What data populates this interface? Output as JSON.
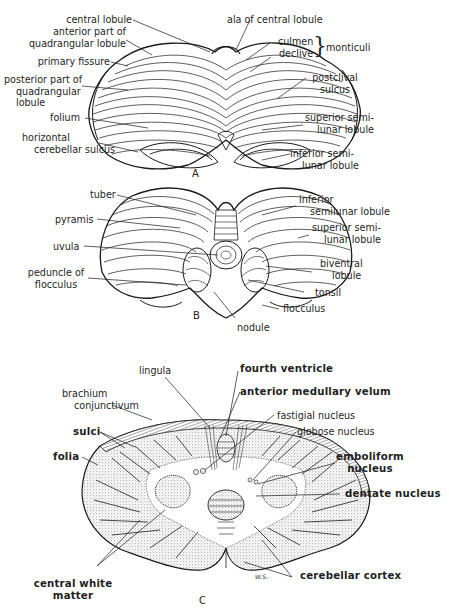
{
  "figure": {
    "panels": [
      {
        "id": "A",
        "view": "superior surface of cerebellum",
        "labels": {
          "central_lobule": "central lobule",
          "anterior_quadrangular": [
            "anterior part of",
            "quadrangular lobule"
          ],
          "primary_fissure": "primary fissure",
          "posterior_quadrangular": [
            "posterior part of",
            "quadrangular",
            "lobule"
          ],
          "folium": "folium",
          "horizontal_sulcus": [
            "horizontal",
            "cerebellar sulcus"
          ],
          "ala_central_lobule": "ala of central lobule",
          "culmen": "culmen",
          "declive": "declive",
          "monticuli": "monticuli",
          "postclival_sulcus": [
            "postclival",
            "sulcus"
          ],
          "superior_semilunar": [
            "superior semi-",
            "lunar lobule"
          ],
          "inferior_semilunar": [
            "inferior semi-",
            "lunar lobule"
          ]
        }
      },
      {
        "id": "B",
        "view": "inferior surface of cerebellum",
        "labels": {
          "tuber": "tuber",
          "pyramis": "pyramis",
          "uvula": "uvula",
          "peduncle_flocculus": [
            "peduncle of",
            "flocculus"
          ],
          "inferior_semilunar": [
            "inferior",
            "semilunar lobule"
          ],
          "superior_semilunar": [
            "superior semi-",
            "lunar lobule"
          ],
          "biventral_lobule": [
            "biventral",
            "lobule"
          ],
          "tonsil": "tonsil",
          "flocculus": "flocculus",
          "nodule": "nodule"
        }
      },
      {
        "id": "C",
        "view": "section through cerebellum",
        "labels": {
          "lingula": "lingula",
          "brachium_conjunctivum": [
            "brachium",
            "conjunctivum"
          ],
          "sulci": "sulci",
          "folia": "folia",
          "central_white_matter": [
            "central white",
            "matter"
          ],
          "fourth_ventricle": "fourth ventricle",
          "anterior_medullary_velum": "anterior medullary velum",
          "fastigial_nucleus": "fastigial nucleus",
          "globose_nucleus": "globose nucleus",
          "emboliform_nucleus": [
            "emboliform",
            "nucleus"
          ],
          "dentate_nucleus": "dentate nucleus",
          "cerebellar_cortex": "cerebellar cortex"
        },
        "signature": "W.S."
      }
    ],
    "colors": {
      "ink": "#1a1a1a",
      "background": "#ffffff",
      "stipple": "#9a9a9a"
    }
  }
}
